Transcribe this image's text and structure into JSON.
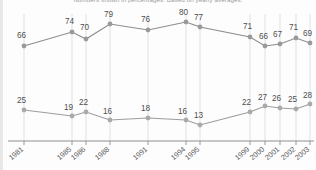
{
  "caption": "Numbers shown in percentages. Based on yearly averages.",
  "chart_data": {
    "type": "line",
    "title": "",
    "subtitle": "Numbers shown in percentages. Based on yearly averages.",
    "xlabel": "",
    "ylabel": "",
    "grid": true,
    "legend_position": "none",
    "ylim": [
      0,
      100
    ],
    "categories": [
      "1981",
      "1985",
      "1986",
      "1988",
      "1991",
      "1994",
      "1995",
      "1999",
      "2000",
      "2001",
      "2002",
      "2003"
    ],
    "series": [
      {
        "name": "upper-series",
        "color": "#8c8c8c",
        "marker_color": "#9a9a9a",
        "values": [
          66,
          74,
          70,
          79,
          76,
          80,
          77,
          71,
          66,
          67,
          71,
          69
        ]
      },
      {
        "name": "lower-series",
        "color": "#9d9d9d",
        "marker_color": "#aaaaaa",
        "values": [
          25,
          19,
          22,
          16,
          18,
          16,
          13,
          22,
          27,
          26,
          25,
          28
        ]
      }
    ],
    "gridline_color": "#dedede",
    "axis_color": "#8f8f8f"
  },
  "x_positions": [
    24,
    72,
    86,
    110,
    148,
    186,
    200,
    250,
    265,
    280,
    296,
    310
  ],
  "upper_points": [
    {
      "x": 24,
      "y": 46,
      "label": "66",
      "lx": 17,
      "ly": 38
    },
    {
      "x": 72,
      "y": 32,
      "label": "74",
      "lx": 65,
      "ly": 24
    },
    {
      "x": 86,
      "y": 39,
      "label": "70",
      "lx": 80,
      "ly": 30
    },
    {
      "x": 110,
      "y": 24,
      "label": "79",
      "lx": 104,
      "ly": 17
    },
    {
      "x": 148,
      "y": 30,
      "label": "76",
      "lx": 141,
      "ly": 22
    },
    {
      "x": 186,
      "y": 22,
      "label": "80",
      "lx": 179,
      "ly": 15
    },
    {
      "x": 200,
      "y": 27,
      "label": "77",
      "lx": 194,
      "ly": 20
    },
    {
      "x": 250,
      "y": 37,
      "label": "71",
      "lx": 243,
      "ly": 29
    },
    {
      "x": 265,
      "y": 46,
      "label": "66",
      "lx": 259,
      "ly": 39
    },
    {
      "x": 280,
      "y": 44,
      "label": "67",
      "lx": 273,
      "ly": 37
    },
    {
      "x": 296,
      "y": 38,
      "label": "71",
      "lx": 289,
      "ly": 30
    },
    {
      "x": 310,
      "y": 43,
      "label": "69",
      "lx": 303,
      "ly": 36
    }
  ],
  "lower_points": [
    {
      "x": 24,
      "y": 110,
      "label": "25",
      "lx": 17,
      "ly": 103
    },
    {
      "x": 72,
      "y": 116,
      "label": "19",
      "lx": 64,
      "ly": 110
    },
    {
      "x": 86,
      "y": 112,
      "label": "22",
      "lx": 79,
      "ly": 105
    },
    {
      "x": 110,
      "y": 120,
      "label": "16",
      "lx": 103,
      "ly": 114
    },
    {
      "x": 148,
      "y": 118,
      "label": "18",
      "lx": 141,
      "ly": 111
    },
    {
      "x": 186,
      "y": 120,
      "label": "16",
      "lx": 178,
      "ly": 114
    },
    {
      "x": 200,
      "y": 125,
      "label": "13",
      "lx": 194,
      "ly": 118
    },
    {
      "x": 250,
      "y": 112,
      "label": "22",
      "lx": 242,
      "ly": 105
    },
    {
      "x": 265,
      "y": 106,
      "label": "27",
      "lx": 258,
      "ly": 100
    },
    {
      "x": 280,
      "y": 108,
      "label": "26",
      "lx": 272,
      "ly": 101
    },
    {
      "x": 296,
      "y": 109,
      "label": "25",
      "lx": 288,
      "ly": 102
    },
    {
      "x": 310,
      "y": 104,
      "label": "28",
      "lx": 303,
      "ly": 98
    }
  ]
}
